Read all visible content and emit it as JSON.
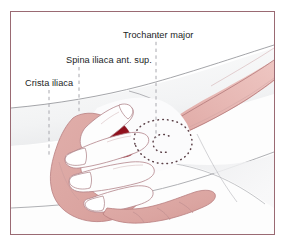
{
  "figure": {
    "type": "anatomical-illustration",
    "frame_color": "#9a6a73",
    "background_color": "#ffffff"
  },
  "labels": [
    {
      "id": "trochanter-major",
      "text": "Trochanter major",
      "leader": "dashed-vertical",
      "leader_color": "#a8a8ae"
    },
    {
      "id": "spina-iliaca-ant-sup",
      "text": "Spina iliaca ant. sup.",
      "leader": "dashed-vertical",
      "leader_color": "#a8a8ae"
    },
    {
      "id": "crista-iliaca",
      "text": "Crista iliaca",
      "leader": "dashed-vertical",
      "leader_color": "#a8a8ae"
    }
  ],
  "palette": {
    "skin_pink": "#dda8a4",
    "skin_pink_light": "#e8c3bf",
    "muscle_red_dark": "#8e0f1c",
    "muscle_red": "#b9202c",
    "thigh_pink": "#e3b0ac",
    "body_white": "#fcfcfc",
    "body_shadow": "#e6e7e9",
    "outline_gray": "#8f9095",
    "outline_rose": "#b77f80",
    "dotted_marker": "#5a3f46",
    "text_color": "#221d1e"
  },
  "annotations": {
    "trochanter_marker": "dotted-outline-hip-trochanter",
    "muscle_highlight": "tensor-fasciae-latae-red-wedge",
    "hand": "examiner-left-hand-palpating"
  }
}
